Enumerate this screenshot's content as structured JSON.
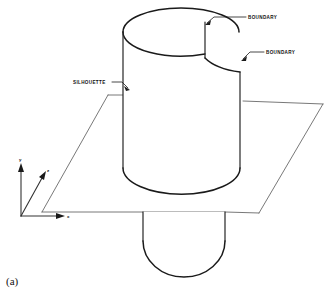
{
  "figure": {
    "caption": "(a)",
    "background_color": "#ffffff",
    "line_color": "#1a1a1a"
  },
  "labels": {
    "boundary_top": "BOUNDARY",
    "boundary_lower": "BOUNDARY",
    "silhouette": "SILHOUETTE"
  },
  "axes": {
    "y_label": "y",
    "z_label": "z",
    "x_label": "x",
    "origin_x": 21,
    "origin_y": 216
  },
  "geometry": {
    "plane_corners": "108,95 323,104 259,213 42,212",
    "cylinder_center_x": 181,
    "cylinder_top_y": 22,
    "cylinder_radius_x": 58,
    "cylinder_radius_y": 22
  }
}
